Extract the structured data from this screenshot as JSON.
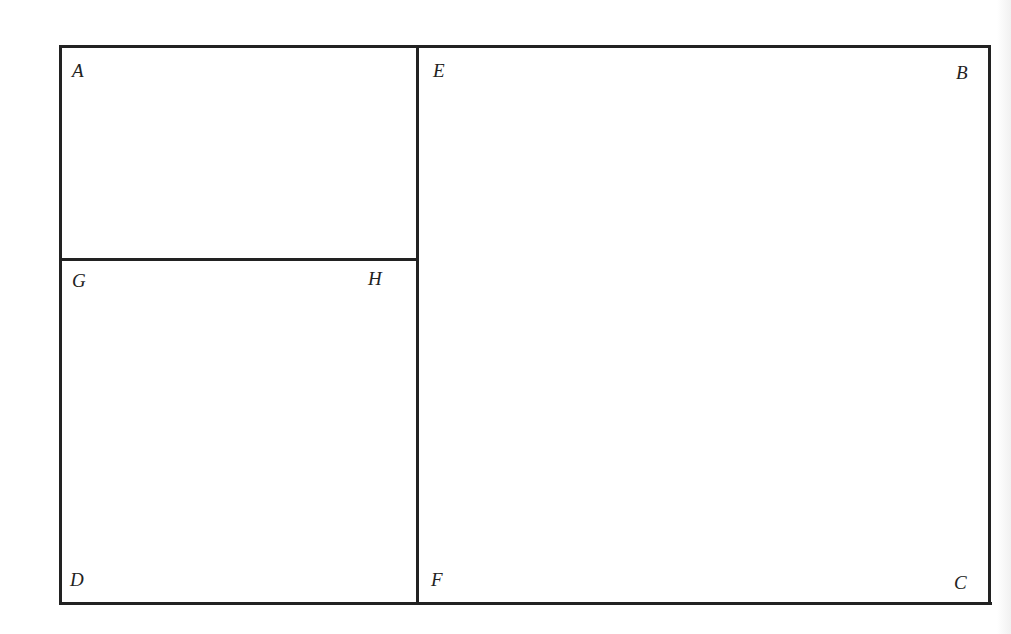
{
  "diagram": {
    "type": "rectangle-partition",
    "line_color": "#222222",
    "outer_rectangle": {
      "corners": [
        "A",
        "B",
        "C",
        "D"
      ]
    },
    "segments": [
      {
        "from": "A",
        "to": "B"
      },
      {
        "from": "B",
        "to": "C"
      },
      {
        "from": "C",
        "to": "D"
      },
      {
        "from": "D",
        "to": "A"
      },
      {
        "from": "E",
        "to": "F"
      },
      {
        "from": "G",
        "to": "H"
      }
    ],
    "labels": {
      "A": "A",
      "B": "B",
      "C": "C",
      "D": "D",
      "E": "E",
      "F": "F",
      "G": "G",
      "H": "H"
    }
  }
}
